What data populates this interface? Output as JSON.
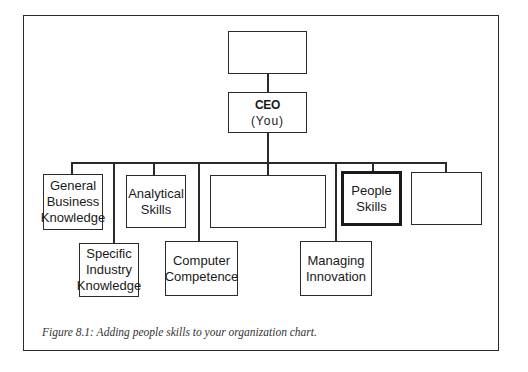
{
  "figure": {
    "caption": "Figure 8.1: Adding people skills to your organization chart."
  },
  "org_chart": {
    "top_box": {
      "label": ""
    },
    "ceo": {
      "title": "CEO",
      "subtitle": "(You)"
    },
    "direct_reports": [
      {
        "id": "general-business-knowledge",
        "lines": [
          "General",
          "Business",
          "Knowledge"
        ]
      },
      {
        "id": "specific-industry-knowledge",
        "lines": [
          "Specific",
          "Industry",
          "Knowledge"
        ]
      },
      {
        "id": "analytical-skills",
        "lines": [
          "Analytical",
          "Skills"
        ]
      },
      {
        "id": "computer-competence",
        "lines": [
          "Computer",
          "Competence"
        ]
      },
      {
        "id": "blank-wide",
        "lines": []
      },
      {
        "id": "managing-innovation",
        "lines": [
          "Managing",
          "Innovation"
        ]
      },
      {
        "id": "people-skills",
        "lines": [
          "People",
          "Skills"
        ],
        "highlighted": true
      },
      {
        "id": "blank-right",
        "lines": []
      }
    ]
  }
}
